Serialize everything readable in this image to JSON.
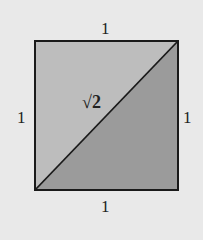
{
  "diagram": {
    "labels": {
      "top": "1",
      "bottom": "1",
      "left": "1",
      "right": "1",
      "diagonal": "√2"
    },
    "colors": {
      "background": "#e9e9e9",
      "upper_triangle": "#bdbdbd",
      "lower_triangle": "#9b9b9b",
      "stroke": "#1a1a1a"
    }
  }
}
